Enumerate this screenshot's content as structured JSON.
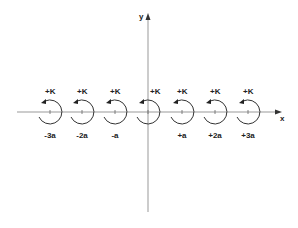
{
  "diagram": {
    "axes": {
      "x_label": "x",
      "y_label": "y",
      "axis_color": "#999999"
    },
    "vortices": [
      {
        "charge": "+K",
        "position": "-3a",
        "cx": 50
      },
      {
        "charge": "+K",
        "position": "-2a",
        "cx": 82
      },
      {
        "charge": "+K",
        "position": "-a",
        "cx": 115
      },
      {
        "charge": "+K",
        "position": "",
        "cx": 148
      },
      {
        "charge": "+K",
        "position": "+a",
        "cx": 182
      },
      {
        "charge": "+K",
        "position": "+2a",
        "cx": 215
      },
      {
        "charge": "+K",
        "position": "+3a",
        "cx": 248
      }
    ],
    "circle_color": "#333333"
  }
}
